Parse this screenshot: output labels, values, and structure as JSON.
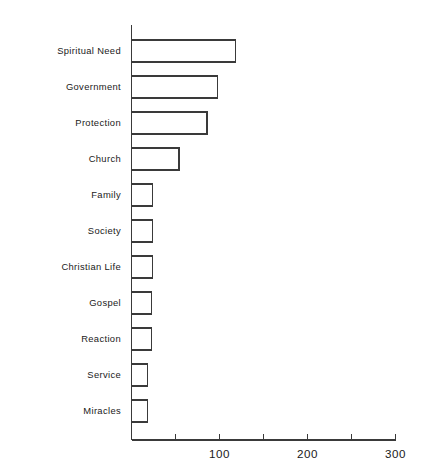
{
  "chart_data": {
    "type": "bar",
    "orientation": "horizontal",
    "title": "",
    "subtitle": "",
    "xlabel": "",
    "ylabel": "",
    "categories": [
      "Spiritual Need",
      "Government",
      "Protection",
      "Church",
      "Family",
      "Society",
      "Christian Life",
      "Gospel",
      "Reaction",
      "Service",
      "Miracles"
    ],
    "values": [
      118,
      98,
      86,
      54,
      24,
      24,
      24,
      23,
      23,
      18,
      18
    ],
    "xlim": [
      0,
      300
    ],
    "ylim": [
      0,
      11
    ],
    "xticks": [
      0,
      50,
      100,
      150,
      200,
      250,
      300
    ],
    "xticklabels": [
      "",
      "",
      "100",
      "",
      "200",
      "",
      "300"
    ],
    "grid": false,
    "legend": null,
    "legend_position": "none",
    "bar_fill": "#ffffff",
    "bar_edge": "#3a3a3a",
    "axis_color": "#3a3a3a",
    "background": "#ffffff"
  },
  "axes": {
    "x_tick_labels_visible": [
      "100",
      "200",
      "300"
    ],
    "origin_label": ""
  }
}
